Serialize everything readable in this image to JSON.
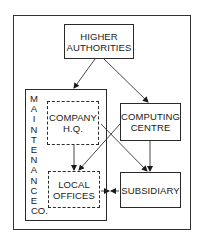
{
  "diagram": {
    "nodes": {
      "higher_authorities": {
        "label_line1": "HIGHER",
        "label_line2": "AUTHORITIES"
      },
      "maintenance_co": {
        "label": "MAINTENANCE CO.",
        "vertical_letters": [
          "M",
          "A",
          "I",
          "N",
          "T",
          "E",
          "N",
          "A",
          "N",
          "C",
          "E",
          "CO."
        ]
      },
      "company_hq": {
        "label_line1": "COMPANY",
        "label_line2": "H.Q."
      },
      "computing_centre": {
        "label_line1": "COMPUTING",
        "label_line2": "CENTRE"
      },
      "local_offices": {
        "label_line1": "LOCAL",
        "label_line2": "OFFICES"
      },
      "subsidiary": {
        "label": "SUBSIDIARY"
      }
    },
    "edges": [
      {
        "from": "HIGHER AUTHORITIES",
        "to": "MAINTENANCE CO."
      },
      {
        "from": "HIGHER AUTHORITIES",
        "to": "COMPUTING CENTRE"
      },
      {
        "from": "COMPANY H.Q.",
        "to": "LOCAL OFFICES"
      },
      {
        "from": "COMPANY H.Q.",
        "to": "SUBSIDIARY"
      },
      {
        "from": "COMPUTING CENTRE",
        "to": "LOCAL OFFICES"
      },
      {
        "from": "COMPUTING CENTRE",
        "to": "SUBSIDIARY"
      },
      {
        "from": "LOCAL OFFICES",
        "to": "SUBSIDIARY",
        "bidirectional": true
      }
    ]
  }
}
